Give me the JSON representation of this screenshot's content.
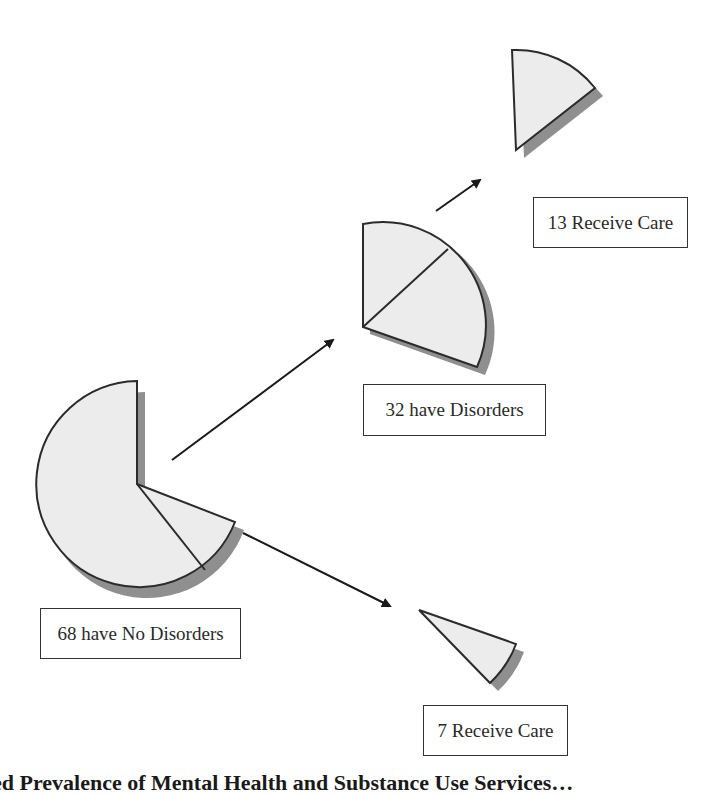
{
  "diagram": {
    "colors": {
      "fill": "#ececec",
      "stroke": "#2b2b2b",
      "shadow": "#8f8f8f"
    },
    "nodes": [
      {
        "id": "no_disorders",
        "label": "68 have No Disorders",
        "value": 68
      },
      {
        "id": "have_disorders",
        "label": "32 have Disorders",
        "value": 32
      },
      {
        "id": "disorders_receive_care",
        "label": "13 Receive Care",
        "value": 13
      },
      {
        "id": "no_disorders_receive_care",
        "label": "7 Receive Care",
        "value": 7
      }
    ],
    "edges": [
      {
        "from": "no_disorders",
        "to": "have_disorders"
      },
      {
        "from": "have_disorders",
        "to": "disorders_receive_care"
      },
      {
        "from": "no_disorders",
        "to": "no_disorders_receive_care"
      }
    ]
  },
  "caption": {
    "text": "…ed Prevalence of Mental Health and Substance Use Services…"
  }
}
